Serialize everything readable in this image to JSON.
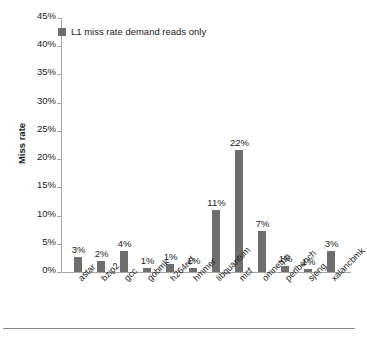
{
  "chart_data": {
    "type": "bar",
    "title": "",
    "subtitle": "",
    "xlabel": "",
    "ylabel": "Miss rate",
    "ylim": [
      0,
      45
    ],
    "ytick_step": 5,
    "ytick_labels": [
      "0%",
      "5%",
      "10%",
      "15%",
      "20%",
      "25%",
      "30%",
      "35%",
      "40%",
      "45%"
    ],
    "ytick_values": [
      0,
      5,
      10,
      15,
      20,
      25,
      30,
      35,
      40,
      45
    ],
    "grid": false,
    "legend_position": "top-left",
    "units": "percent",
    "categories": [
      "astar",
      "bzip2",
      "gcc",
      "gobmk",
      "h264ref",
      "hmmer",
      "libquantum",
      "mcf",
      "omnetpp",
      "perlbench",
      "sjeng",
      "xalancbmk"
    ],
    "series": [
      {
        "name": "L1 miss rate demand reads only",
        "color": "#6e6e6e",
        "values": [
          2.7,
          2.0,
          3.8,
          0.8,
          1.5,
          0.8,
          11.0,
          21.7,
          7.3,
          1.1,
          0.6,
          3.7
        ],
        "data_labels": [
          "3%",
          "2%",
          "4%",
          "1%",
          "1%",
          "1%",
          "11%",
          "22%",
          "7%",
          "1%",
          "1%",
          "3%"
        ]
      }
    ]
  },
  "legend": {
    "entries": [
      {
        "label": "L1 miss rate demand reads only",
        "color": "#6e6e6e"
      }
    ]
  },
  "colors": {
    "bar": "#6e6e6e",
    "axis": "#a6a6a6",
    "text": "#1a1a1a",
    "rule": "#8c8c8c",
    "background": "#ffffff"
  }
}
